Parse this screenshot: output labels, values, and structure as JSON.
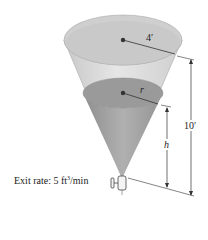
{
  "diagram": {
    "type": "conical-tank",
    "labels": {
      "top_radius": "4′",
      "water_radius": "r",
      "total_height": "10′",
      "water_height": "h",
      "exit_rate_prefix": "Exit rate: 5 ft",
      "exit_rate_exp": "3",
      "exit_rate_suffix": "/min"
    },
    "colors": {
      "cone_light": "#d9d9d9",
      "cone_mid": "#bdbdbd",
      "water": "#9e9e9e",
      "water_surface": "#8f8f8f",
      "lines": "#333333"
    }
  }
}
